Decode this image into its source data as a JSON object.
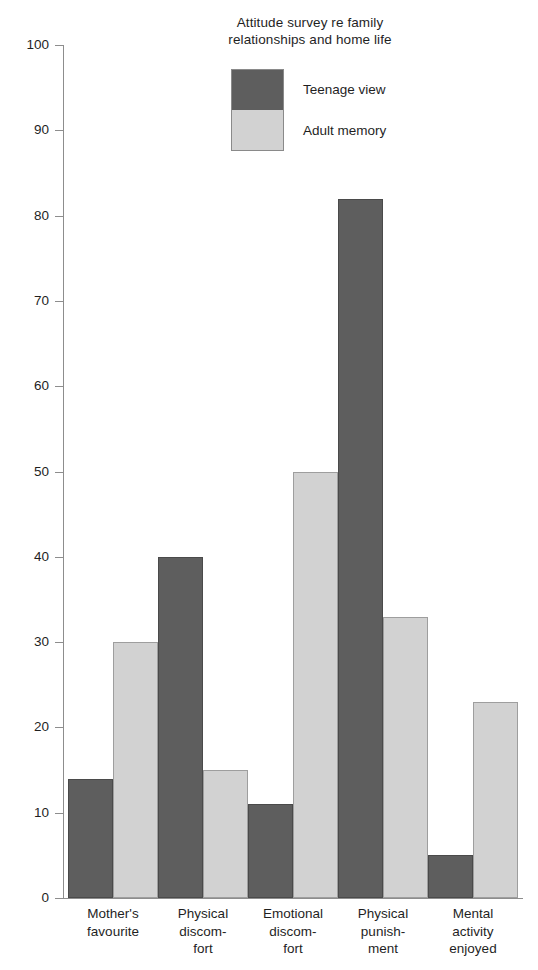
{
  "chart_data": {
    "type": "bar",
    "title": "Attitude survey re family relationships and home life",
    "title_lines": [
      "Attitude survey re family",
      "relationships and home life"
    ],
    "xlabel": "",
    "ylabel": "",
    "ylim": [
      0,
      100
    ],
    "yticks": [
      0,
      10,
      20,
      30,
      40,
      50,
      60,
      70,
      80,
      90,
      100
    ],
    "ytick_labels": [
      "0",
      "10",
      "20",
      "30",
      "40",
      "50",
      "60",
      "70",
      "80",
      "90",
      "100"
    ],
    "grid": false,
    "legend_position": "top-center",
    "categories": [
      "Mother's favourite",
      "Physical discomfort",
      "Emotional discomfort",
      "Physical punishment",
      "Mental activity enjoyed"
    ],
    "category_label_lines": [
      [
        "Mother's",
        "favourite"
      ],
      [
        "Physical",
        "discom-",
        "fort"
      ],
      [
        "Emotional",
        "discom-",
        "fort"
      ],
      [
        "Physical",
        "punish-",
        "ment"
      ],
      [
        "Mental",
        "activity",
        "enjoyed"
      ]
    ],
    "series": [
      {
        "name": "Teenage view",
        "color": "#5e5e5e",
        "values": [
          14,
          40,
          11,
          82,
          5
        ]
      },
      {
        "name": "Adult memory",
        "color": "#d2d2d2",
        "values": [
          30,
          15,
          50,
          33,
          23
        ]
      }
    ]
  },
  "legend": {
    "items": [
      {
        "label": "Teenage view",
        "swatch": "dark"
      },
      {
        "label": "Adult memory",
        "swatch": "light"
      }
    ]
  },
  "axis": {
    "color": "#8d8d8d"
  }
}
